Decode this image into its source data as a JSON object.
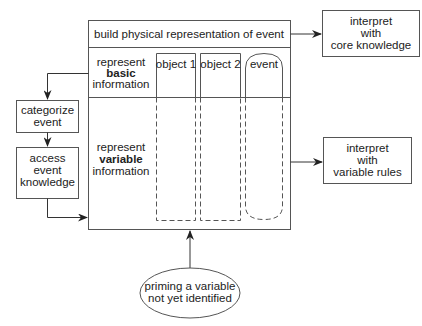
{
  "colors": {
    "stroke": "#555555",
    "text": "#222222",
    "background": "#ffffff"
  },
  "main_box": {
    "title": "build physical representation of event",
    "basic_row": {
      "line1": "represent",
      "line2": "basic",
      "line3": "information"
    },
    "variable_row": {
      "line1": "represent",
      "line2": "variable",
      "line3": "information"
    },
    "columns": [
      {
        "label": "object 1"
      },
      {
        "label": "object 2"
      },
      {
        "label": "event"
      }
    ]
  },
  "side_boxes": {
    "categorize": {
      "line1": "categorize",
      "line2": "event"
    },
    "access": {
      "line1": "access",
      "line2": "event",
      "line3": "knowledge"
    }
  },
  "output_boxes": {
    "core": {
      "line1": "interpret",
      "line2": "with",
      "line3": "core knowledge"
    },
    "variable": {
      "line1": "interpret",
      "line2": "with",
      "line3": "variable rules"
    }
  },
  "priming": {
    "line1": "priming a variable",
    "line2": "not yet identified"
  }
}
